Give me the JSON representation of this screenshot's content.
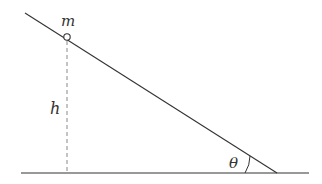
{
  "diagram": {
    "type": "inclined-plane",
    "labels": {
      "mass": "m",
      "height": "h",
      "angle": "θ"
    },
    "colors": {
      "line": "#333333",
      "dashed": "#888888",
      "background": "#ffffff"
    },
    "geometry": {
      "incline_start": [
        25,
        13
      ],
      "incline_end": [
        277,
        173
      ],
      "ground_start": [
        21,
        173
      ],
      "ground_end": [
        309,
        173
      ],
      "mass_center": [
        67,
        37
      ],
      "mass_radius": 3
    }
  }
}
